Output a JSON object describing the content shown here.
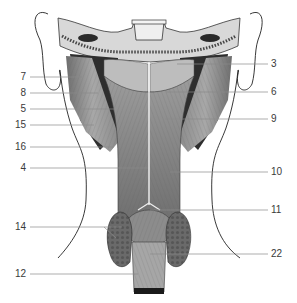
{
  "figure": {
    "colors": {
      "muscle_light": "#cfcfcf",
      "muscle_mid": "#9a9a9a",
      "muscle_dark": "#5a5a5a",
      "shadow": "#2a2a2a",
      "bone": "#e6e6e6",
      "outline": "#222222",
      "leader_line": "#8a8a8a",
      "label_text": "#3a3a3a"
    }
  },
  "labels": {
    "left": [
      {
        "text": "7",
        "y": 77,
        "x_end": 82
      },
      {
        "text": "8",
        "y": 93,
        "x_end": 98
      },
      {
        "text": "5",
        "y": 109,
        "x_end": 114
      },
      {
        "text": "15",
        "y": 125,
        "x_end": 94
      },
      {
        "text": "16",
        "y": 147,
        "x_end": 114
      },
      {
        "text": "4",
        "y": 168,
        "x_end": 148
      },
      {
        "text": "14",
        "y": 227,
        "x_end": 122
      },
      {
        "text": "12",
        "y": 274,
        "x_end": 138
      }
    ],
    "right": [
      {
        "text": "3",
        "y": 64,
        "x_start": 177
      },
      {
        "text": "6",
        "y": 92,
        "x_start": 166
      },
      {
        "text": "9",
        "y": 119,
        "x_start": 165
      },
      {
        "text": "10",
        "y": 172,
        "x_start": 170
      },
      {
        "text": "11",
        "y": 210,
        "x_start": 150
      },
      {
        "text": "22",
        "y": 254,
        "x_start": 150
      }
    ]
  }
}
